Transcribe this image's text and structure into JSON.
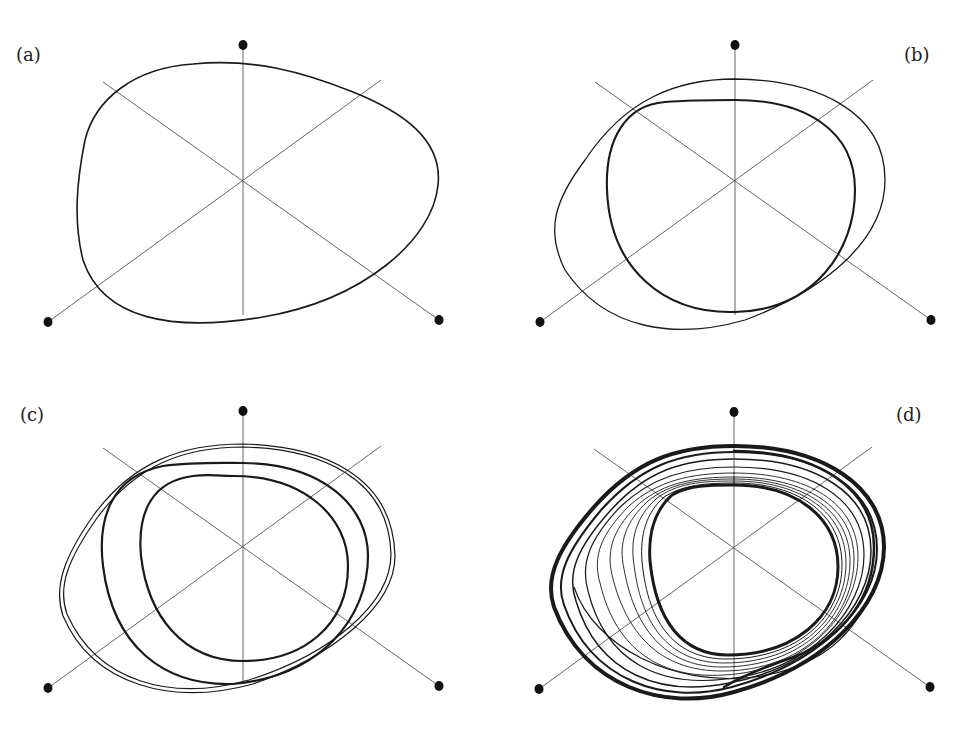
{
  "figure": {
    "colors": {
      "orbit": "#1a1a1a",
      "axis": "#555555",
      "dot": "#111111",
      "background": "#ffffff"
    },
    "panels": [
      {
        "label": "(a)",
        "kind": "limit-cycle, period-1",
        "loops": 1
      },
      {
        "label": "(b)",
        "kind": "period-2 orbit",
        "loops": 2
      },
      {
        "label": "(c)",
        "kind": "period-4 orbit",
        "loops": 4
      },
      {
        "label": "(d)",
        "kind": "chaotic attractor",
        "loops": "many"
      }
    ]
  }
}
